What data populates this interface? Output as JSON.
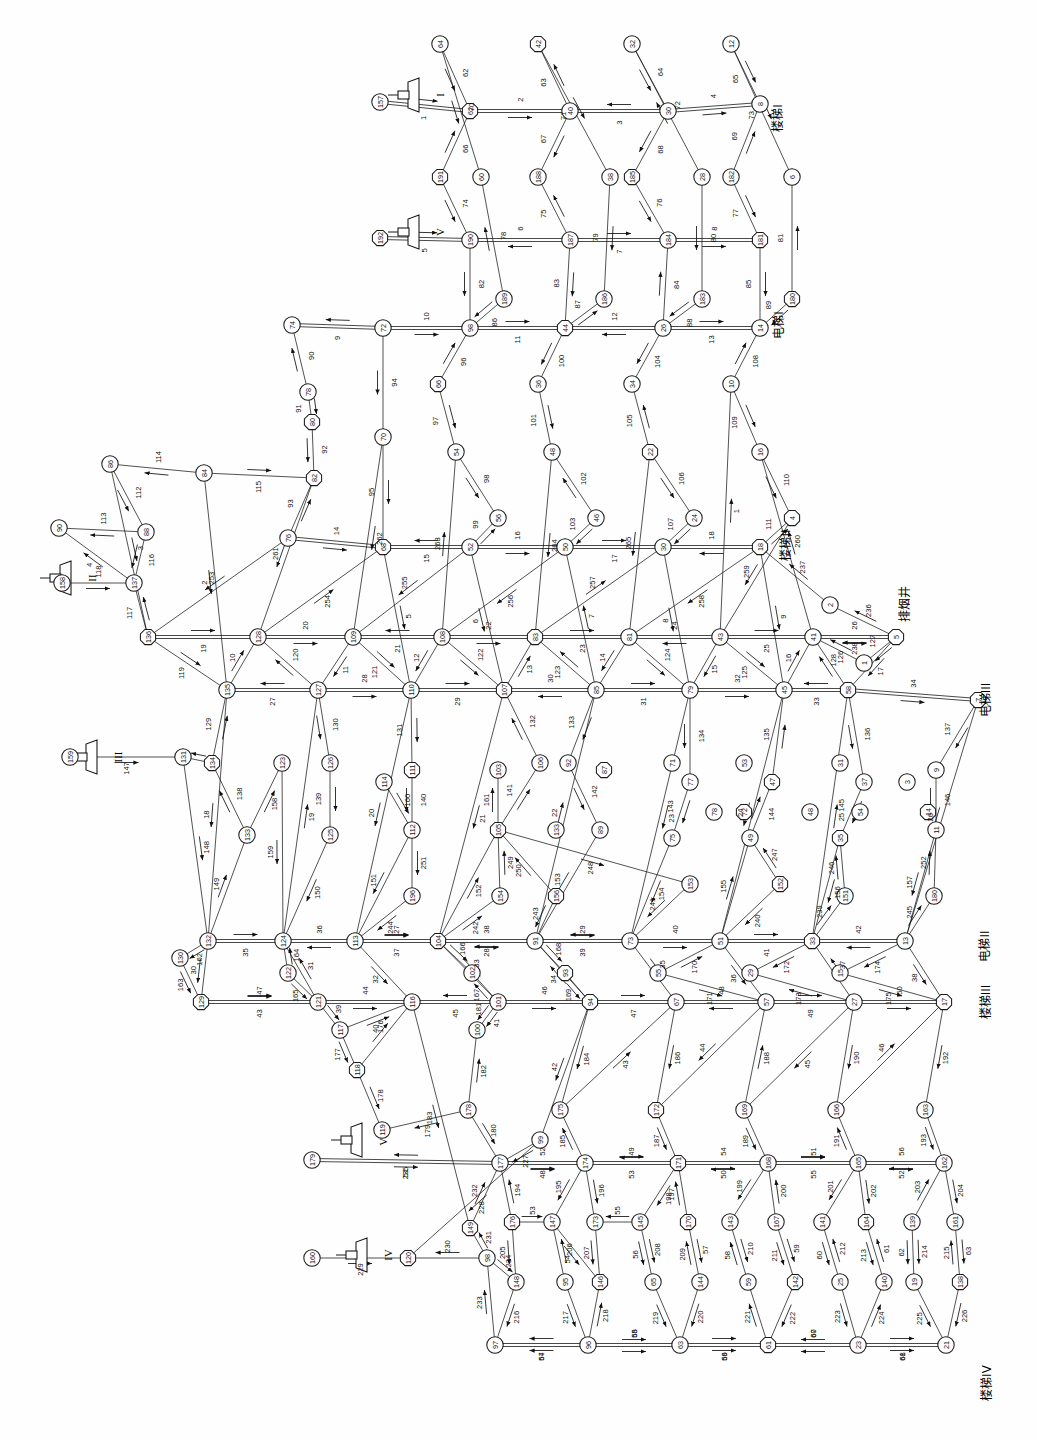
{
  "diagram": {
    "type": "directed-network-graph",
    "orientation": "rotated-90",
    "node_count": 199,
    "branch_count": 265,
    "node_shape": "circle-and-octagon",
    "line_color": "#1a1a1a",
    "background_color": "#ffffff"
  },
  "labels": [
    {
      "id": "stair-1",
      "text": "楼梯I",
      "x": 778,
      "y": 118,
      "rotate": -90
    },
    {
      "id": "stair-2",
      "text": "楼梯II",
      "x": 786,
      "y": 545,
      "rotate": -90
    },
    {
      "id": "stair-3",
      "text": "楼梯III",
      "x": 986,
      "y": 1002,
      "rotate": -90
    },
    {
      "id": "stair-4",
      "text": "楼梯IV",
      "x": 987,
      "y": 1383,
      "rotate": -90
    },
    {
      "id": "elev-1",
      "text": "电梯I",
      "x": 779,
      "y": 325,
      "rotate": -90
    },
    {
      "id": "elev-2",
      "text": "电梯II",
      "x": 985,
      "y": 946,
      "rotate": -90
    },
    {
      "id": "elev-3",
      "text": "电梯III",
      "x": 986,
      "y": 700,
      "rotate": -90
    },
    {
      "id": "smoke-shaft",
      "text": "排烟井",
      "x": 905,
      "y": 604,
      "rotate": -90
    }
  ],
  "fans": [
    {
      "id": "fan-1",
      "roman": "I",
      "x": 410,
      "y": 95,
      "node": "157",
      "edge": "91"
    },
    {
      "id": "fan-2",
      "roman": "II",
      "x": 62,
      "y": 578,
      "node": "158",
      "edge": "198"
    },
    {
      "id": "fan-3",
      "roman": "III",
      "x": 88,
      "y": 757,
      "node": "159",
      "edge": "197"
    },
    {
      "id": "fan-4",
      "roman": "IV",
      "x": 358,
      "y": 1255,
      "node": "160",
      "edge": "177"
    },
    {
      "id": "fan-5",
      "roman": "V",
      "x": 410,
      "y": 232,
      "node": "192",
      "edge": "249"
    },
    {
      "id": "fan-6",
      "roman": "VI",
      "x": 353,
      "y": 1140,
      "node": "179",
      "edge": "245"
    }
  ],
  "nodes": [
    {
      "n": "64",
      "x": 440,
      "y": 44
    },
    {
      "n": "42",
      "x": 538,
      "y": 44
    },
    {
      "n": "32",
      "x": 632,
      "y": 44
    },
    {
      "n": "12",
      "x": 731,
      "y": 44
    },
    {
      "n": "157",
      "x": 380,
      "y": 102
    },
    {
      "n": "62",
      "x": 470,
      "y": 111
    },
    {
      "n": "40",
      "x": 570,
      "y": 111
    },
    {
      "n": "30",
      "x": 668,
      "y": 111
    },
    {
      "n": "8",
      "x": 760,
      "y": 104
    },
    {
      "n": "191",
      "x": 440,
      "y": 177
    },
    {
      "n": "60",
      "x": 481,
      "y": 177
    },
    {
      "n": "188",
      "x": 538,
      "y": 177
    },
    {
      "n": "38",
      "x": 610,
      "y": 177
    },
    {
      "n": "185",
      "x": 632,
      "y": 177
    },
    {
      "n": "28",
      "x": 702,
      "y": 177
    },
    {
      "n": "182",
      "x": 731,
      "y": 177
    },
    {
      "n": "6",
      "x": 792,
      "y": 177
    },
    {
      "n": "192",
      "x": 380,
      "y": 238
    },
    {
      "n": "190",
      "x": 470,
      "y": 240
    },
    {
      "n": "187",
      "x": 570,
      "y": 240
    },
    {
      "n": "184",
      "x": 668,
      "y": 240
    },
    {
      "n": "181",
      "x": 760,
      "y": 240
    },
    {
      "n": "189",
      "x": 504,
      "y": 299
    },
    {
      "n": "186",
      "x": 604,
      "y": 299
    },
    {
      "n": "183",
      "x": 702,
      "y": 299
    },
    {
      "n": "180",
      "x": 792,
      "y": 299
    },
    {
      "n": "74",
      "x": 292,
      "y": 325
    },
    {
      "n": "72",
      "x": 383,
      "y": 328
    },
    {
      "n": "98",
      "x": 470,
      "y": 328
    },
    {
      "n": "44",
      "x": 565,
      "y": 328
    },
    {
      "n": "26",
      "x": 663,
      "y": 328
    },
    {
      "n": "14",
      "x": 760,
      "y": 328
    },
    {
      "n": "78",
      "x": 308,
      "y": 392
    },
    {
      "n": "66",
      "x": 438,
      "y": 384
    },
    {
      "n": "36",
      "x": 538,
      "y": 384
    },
    {
      "n": "34",
      "x": 632,
      "y": 384
    },
    {
      "n": "10",
      "x": 731,
      "y": 384
    },
    {
      "n": "80",
      "x": 312,
      "y": 422
    },
    {
      "n": "70",
      "x": 383,
      "y": 437
    },
    {
      "n": "54",
      "x": 456,
      "y": 452
    },
    {
      "n": "48",
      "x": 552,
      "y": 452
    },
    {
      "n": "22",
      "x": 650,
      "y": 452
    },
    {
      "n": "16",
      "x": 760,
      "y": 452
    },
    {
      "n": "86",
      "x": 110,
      "y": 464
    },
    {
      "n": "84",
      "x": 204,
      "y": 473
    },
    {
      "n": "82",
      "x": 314,
      "y": 478
    },
    {
      "n": "56",
      "x": 498,
      "y": 518
    },
    {
      "n": "46",
      "x": 596,
      "y": 518
    },
    {
      "n": "24",
      "x": 694,
      "y": 518
    },
    {
      "n": "4",
      "x": 792,
      "y": 518
    },
    {
      "n": "90",
      "x": 59,
      "y": 528
    },
    {
      "n": "88",
      "x": 146,
      "y": 532
    },
    {
      "n": "76",
      "x": 288,
      "y": 538
    },
    {
      "n": "68",
      "x": 383,
      "y": 547
    },
    {
      "n": "52",
      "x": 470,
      "y": 547
    },
    {
      "n": "50",
      "x": 565,
      "y": 547
    },
    {
      "n": "30b",
      "x": 663,
      "y": 547
    },
    {
      "n": "18",
      "x": 760,
      "y": 547
    },
    {
      "n": "158",
      "x": 62,
      "y": 583
    },
    {
      "n": "137",
      "x": 134,
      "y": 583
    },
    {
      "n": "2",
      "x": 830,
      "y": 605
    },
    {
      "n": "136",
      "x": 148,
      "y": 637
    },
    {
      "n": "128",
      "x": 258,
      "y": 637
    },
    {
      "n": "109",
      "x": 353,
      "y": 637
    },
    {
      "n": "108",
      "x": 442,
      "y": 637
    },
    {
      "n": "83",
      "x": 535,
      "y": 637
    },
    {
      "n": "81",
      "x": 629,
      "y": 637
    },
    {
      "n": "43",
      "x": 720,
      "y": 637
    },
    {
      "n": "41",
      "x": 813,
      "y": 637
    },
    {
      "n": "5",
      "x": 896,
      "y": 637
    },
    {
      "n": "135",
      "x": 227,
      "y": 690
    },
    {
      "n": "127",
      "x": 318,
      "y": 690
    },
    {
      "n": "110",
      "x": 411,
      "y": 690
    },
    {
      "n": "107",
      "x": 504,
      "y": 690
    },
    {
      "n": "85",
      "x": 596,
      "y": 690
    },
    {
      "n": "79",
      "x": 690,
      "y": 690
    },
    {
      "n": "45",
      "x": 784,
      "y": 690
    },
    {
      "n": "58",
      "x": 848,
      "y": 690
    },
    {
      "n": "1",
      "x": 864,
      "y": 663
    },
    {
      "n": "159",
      "x": 70,
      "y": 757
    },
    {
      "n": "131",
      "x": 183,
      "y": 757
    },
    {
      "n": "134",
      "x": 212,
      "y": 763
    },
    {
      "n": "123",
      "x": 282,
      "y": 763
    },
    {
      "n": "126",
      "x": 330,
      "y": 763
    },
    {
      "n": "114",
      "x": 384,
      "y": 782
    },
    {
      "n": "111",
      "x": 412,
      "y": 770
    },
    {
      "n": "103",
      "x": 498,
      "y": 770
    },
    {
      "n": "106",
      "x": 540,
      "y": 763
    },
    {
      "n": "92",
      "x": 568,
      "y": 763
    },
    {
      "n": "87",
      "x": 604,
      "y": 770
    },
    {
      "n": "71",
      "x": 672,
      "y": 763
    },
    {
      "n": "77",
      "x": 690,
      "y": 782
    },
    {
      "n": "53",
      "x": 744,
      "y": 763
    },
    {
      "n": "47",
      "x": 772,
      "y": 782
    },
    {
      "n": "31",
      "x": 840,
      "y": 763
    },
    {
      "n": "37",
      "x": 864,
      "y": 782
    },
    {
      "n": "9",
      "x": 936,
      "y": 770
    },
    {
      "n": "7",
      "x": 978,
      "y": 700
    },
    {
      "n": "133",
      "x": 247,
      "y": 835
    },
    {
      "n": "125",
      "x": 330,
      "y": 835
    },
    {
      "n": "112",
      "x": 412,
      "y": 830
    },
    {
      "n": "105",
      "x": 498,
      "y": 830
    },
    {
      "n": "133b",
      "x": 556,
      "y": 830
    },
    {
      "n": "89",
      "x": 600,
      "y": 830
    },
    {
      "n": "75",
      "x": 672,
      "y": 838
    },
    {
      "n": "72b",
      "x": 744,
      "y": 812
    },
    {
      "n": "49",
      "x": 750,
      "y": 838
    },
    {
      "n": "78b",
      "x": 714,
      "y": 812
    },
    {
      "n": "54b",
      "x": 860,
      "y": 812
    },
    {
      "n": "35",
      "x": 840,
      "y": 838
    },
    {
      "n": "48b",
      "x": 810,
      "y": 812
    },
    {
      "n": "11",
      "x": 936,
      "y": 830
    },
    {
      "n": "3",
      "x": 907,
      "y": 782
    },
    {
      "n": "14b",
      "x": 928,
      "y": 812
    },
    {
      "n": "132",
      "x": 208,
      "y": 941
    },
    {
      "n": "124",
      "x": 283,
      "y": 941
    },
    {
      "n": "113",
      "x": 355,
      "y": 941
    },
    {
      "n": "104",
      "x": 438,
      "y": 941
    },
    {
      "n": "91",
      "x": 535,
      "y": 941
    },
    {
      "n": "73",
      "x": 630,
      "y": 941
    },
    {
      "n": "51",
      "x": 720,
      "y": 941
    },
    {
      "n": "33",
      "x": 812,
      "y": 941
    },
    {
      "n": "13",
      "x": 905,
      "y": 941
    },
    {
      "n": "122",
      "x": 288,
      "y": 973
    },
    {
      "n": "102",
      "x": 472,
      "y": 973
    },
    {
      "n": "93",
      "x": 565,
      "y": 973
    },
    {
      "n": "55",
      "x": 658,
      "y": 973
    },
    {
      "n": "29",
      "x": 750,
      "y": 973
    },
    {
      "n": "15",
      "x": 840,
      "y": 973
    },
    {
      "n": "152",
      "x": 780,
      "y": 884
    },
    {
      "n": "151",
      "x": 845,
      "y": 896
    },
    {
      "n": "153",
      "x": 690,
      "y": 884
    },
    {
      "n": "154",
      "x": 500,
      "y": 896
    },
    {
      "n": "156",
      "x": 556,
      "y": 896
    },
    {
      "n": "196",
      "x": 412,
      "y": 896
    },
    {
      "n": "130",
      "x": 180,
      "y": 958
    },
    {
      "n": "180b",
      "x": 934,
      "y": 896
    },
    {
      "n": "129",
      "x": 201,
      "y": 1002
    },
    {
      "n": "121",
      "x": 318,
      "y": 1002
    },
    {
      "n": "116",
      "x": 412,
      "y": 1002
    },
    {
      "n": "101",
      "x": 498,
      "y": 1002
    },
    {
      "n": "94",
      "x": 590,
      "y": 1002
    },
    {
      "n": "67",
      "x": 676,
      "y": 1002
    },
    {
      "n": "57",
      "x": 766,
      "y": 1002
    },
    {
      "n": "27",
      "x": 854,
      "y": 1002
    },
    {
      "n": "17",
      "x": 944,
      "y": 1002
    },
    {
      "n": "117",
      "x": 340,
      "y": 1030
    },
    {
      "n": "100",
      "x": 477,
      "y": 1030
    },
    {
      "n": "175",
      "x": 560,
      "y": 1110
    },
    {
      "n": "172",
      "x": 656,
      "y": 1110
    },
    {
      "n": "169",
      "x": 744,
      "y": 1110
    },
    {
      "n": "166",
      "x": 836,
      "y": 1110
    },
    {
      "n": "163",
      "x": 925,
      "y": 1110
    },
    {
      "n": "118",
      "x": 357,
      "y": 1070
    },
    {
      "n": "178",
      "x": 468,
      "y": 1110
    },
    {
      "n": "99",
      "x": 540,
      "y": 1140
    },
    {
      "n": "119",
      "x": 382,
      "y": 1130
    },
    {
      "n": "149",
      "x": 470,
      "y": 1228
    },
    {
      "n": "179",
      "x": 312,
      "y": 1160
    },
    {
      "n": "177",
      "x": 500,
      "y": 1163
    },
    {
      "n": "174",
      "x": 585,
      "y": 1163
    },
    {
      "n": "171",
      "x": 678,
      "y": 1163
    },
    {
      "n": "168",
      "x": 768,
      "y": 1163
    },
    {
      "n": "165",
      "x": 858,
      "y": 1163
    },
    {
      "n": "162",
      "x": 944,
      "y": 1163
    },
    {
      "n": "176",
      "x": 512,
      "y": 1222
    },
    {
      "n": "147",
      "x": 552,
      "y": 1222
    },
    {
      "n": "173",
      "x": 595,
      "y": 1222
    },
    {
      "n": "145",
      "x": 640,
      "y": 1222
    },
    {
      "n": "170",
      "x": 688,
      "y": 1222
    },
    {
      "n": "143",
      "x": 730,
      "y": 1222
    },
    {
      "n": "167",
      "x": 776,
      "y": 1222
    },
    {
      "n": "141",
      "x": 822,
      "y": 1222
    },
    {
      "n": "164",
      "x": 866,
      "y": 1222
    },
    {
      "n": "139",
      "x": 912,
      "y": 1222
    },
    {
      "n": "161",
      "x": 955,
      "y": 1222
    },
    {
      "n": "160",
      "x": 312,
      "y": 1258
    },
    {
      "n": "120",
      "x": 408,
      "y": 1258
    },
    {
      "n": "98b",
      "x": 487,
      "y": 1258
    },
    {
      "n": "148",
      "x": 516,
      "y": 1282
    },
    {
      "n": "95",
      "x": 565,
      "y": 1282
    },
    {
      "n": "146",
      "x": 600,
      "y": 1282
    },
    {
      "n": "65",
      "x": 653,
      "y": 1282
    },
    {
      "n": "144",
      "x": 700,
      "y": 1282
    },
    {
      "n": "59",
      "x": 748,
      "y": 1282
    },
    {
      "n": "142",
      "x": 795,
      "y": 1282
    },
    {
      "n": "25",
      "x": 840,
      "y": 1282
    },
    {
      "n": "140",
      "x": 884,
      "y": 1282
    },
    {
      "n": "19",
      "x": 914,
      "y": 1282
    },
    {
      "n": "138",
      "x": 960,
      "y": 1282
    },
    {
      "n": "97",
      "x": 495,
      "y": 1345
    },
    {
      "n": "96",
      "x": 588,
      "y": 1345
    },
    {
      "n": "63",
      "x": 680,
      "y": 1345
    },
    {
      "n": "61",
      "x": 768,
      "y": 1345
    },
    {
      "n": "23",
      "x": 858,
      "y": 1345
    },
    {
      "n": "21",
      "x": 946,
      "y": 1345
    }
  ],
  "horizontal_trunks": [
    {
      "row": "r1",
      "y": 111,
      "nodes": [
        "157",
        "62",
        "40",
        "30",
        "8"
      ],
      "edges": [
        "91",
        "49",
        "47",
        "13"
      ]
    },
    {
      "row": "r2",
      "y": 240,
      "nodes": [
        "192",
        "190",
        "187",
        "184",
        "181"
      ],
      "edges": [
        "249",
        "248",
        "247",
        "246"
      ]
    },
    {
      "row": "r3",
      "y": 328,
      "nodes": [
        "74",
        "72",
        "98",
        "44",
        "26",
        "14"
      ],
      "edges": [
        "95",
        "79",
        "63",
        "21",
        "259"
      ]
    },
    {
      "row": "r4",
      "y": 547,
      "nodes": [
        "76",
        "68",
        "52",
        "50",
        "30b",
        "18"
      ],
      "edges": [
        "99",
        "71",
        "69",
        "27",
        "25"
      ]
    },
    {
      "row": "r5",
      "y": 637,
      "nodes": [
        "136",
        "128",
        "109",
        "108",
        "83",
        "81",
        "43",
        "41",
        "5"
      ],
      "edges": [
        "188",
        "161",
        "160",
        "124",
        "122",
        "64",
        "62",
        "8"
      ]
    },
    {
      "row": "r6",
      "y": 690,
      "nodes": [
        "135",
        "127",
        "110",
        "107",
        "85",
        "79",
        "45",
        "58",
        "7"
      ],
      "edges": [
        "187",
        "164",
        "158",
        "128",
        "118",
        "68",
        "2",
        "12"
      ]
    },
    {
      "row": "r7",
      "y": 941,
      "nodes": [
        "132",
        "124",
        "113",
        "104",
        "91",
        "73",
        "51",
        "33",
        "13"
      ],
      "edges": [
        "182",
        "167",
        "155",
        "135",
        "112",
        "76",
        "50",
        "18"
      ]
    },
    {
      "row": "r8",
      "y": 1002,
      "nodes": [
        "129",
        "121",
        "116",
        "101",
        "94",
        "67",
        "57",
        "27",
        "17"
      ],
      "edges": [
        "179",
        "171",
        "149",
        "138",
        "104",
        "84",
        "44",
        "26"
      ]
    },
    {
      "row": "r9",
      "y": 1163,
      "nodes": [
        "179",
        "177",
        "174",
        "171",
        "168",
        "165",
        "162"
      ],
      "edges": [
        "245",
        "237",
        "243",
        "242",
        "241",
        "240"
      ]
    },
    {
      "row": "r10",
      "y": 1345,
      "nodes": [
        "97",
        "96",
        "63",
        "61",
        "23",
        "21"
      ],
      "edges": [
        "142",
        "94",
        "92",
        "34",
        "32"
      ]
    }
  ],
  "edge_numbers_all": [
    1,
    2,
    3,
    4,
    5,
    6,
    7,
    8,
    9,
    10,
    11,
    12,
    13,
    14,
    15,
    16,
    17,
    18,
    19,
    20,
    21,
    22,
    23,
    24,
    25,
    26,
    27,
    28,
    29,
    30,
    31,
    32,
    33,
    34,
    35,
    36,
    37,
    38,
    39,
    40,
    41,
    42,
    43,
    44,
    45,
    46,
    47,
    48,
    49,
    50,
    51,
    52,
    53,
    54,
    55,
    56,
    57,
    58,
    59,
    60,
    61,
    62,
    63,
    64,
    65,
    66,
    67,
    68,
    69,
    70,
    71,
    72,
    73,
    74,
    75,
    76,
    77,
    78,
    79,
    80,
    81,
    82,
    83,
    84,
    85,
    86,
    87,
    88,
    89,
    90,
    91,
    92,
    93,
    94,
    95,
    96,
    97,
    98,
    99,
    100,
    101,
    102,
    103,
    104,
    105,
    106,
    107,
    108,
    109,
    110,
    111,
    112,
    113,
    114,
    115,
    116,
    117,
    118,
    119,
    120,
    121,
    122,
    123,
    124,
    125,
    126,
    127,
    128,
    129,
    130,
    131,
    132,
    133,
    134,
    135,
    136,
    137,
    138,
    139,
    140,
    141,
    142,
    143,
    144,
    145,
    146,
    147,
    148,
    149,
    150,
    151,
    152,
    153,
    154,
    155,
    156,
    157,
    158,
    159,
    160,
    161,
    162,
    163,
    164,
    165,
    166,
    167,
    168,
    169,
    170,
    171,
    172,
    173,
    174,
    175,
    176,
    177,
    178,
    179,
    180,
    181,
    182,
    183,
    184,
    185,
    186,
    187,
    188,
    189,
    190,
    191,
    192,
    193,
    194,
    195,
    196,
    197,
    198,
    199,
    200,
    201,
    202,
    203,
    204,
    205,
    206,
    207,
    208,
    209,
    210,
    211,
    212,
    213,
    214,
    215,
    216,
    217,
    218,
    219,
    220,
    221,
    222,
    223,
    224,
    225,
    226,
    227,
    228,
    229,
    230,
    231,
    232,
    233,
    234,
    235,
    236,
    237,
    238,
    239,
    240,
    241,
    242,
    243,
    244,
    245,
    246,
    247,
    248,
    249,
    250,
    251,
    252,
    253,
    254,
    255,
    256,
    257,
    258,
    259,
    260,
    261,
    262,
    263,
    264,
    265
  ]
}
